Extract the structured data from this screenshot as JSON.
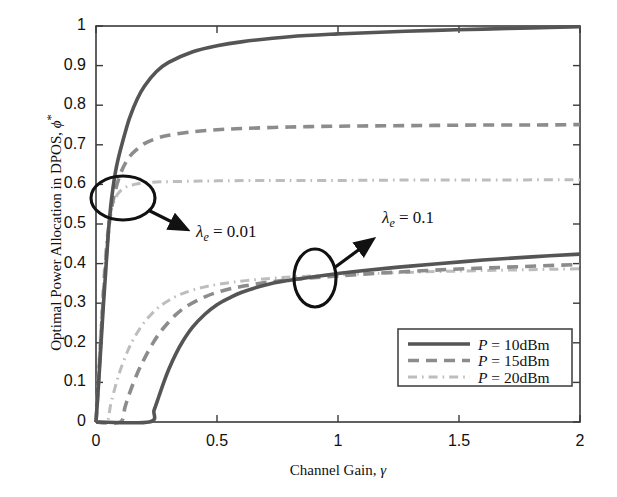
{
  "chart_data": {
    "type": "line",
    "title": "",
    "xlabel": "Channel Gain, γ",
    "ylabel": "Optimal Power Allocation in DPOS, ϕ*",
    "xlim": [
      0,
      2
    ],
    "ylim": [
      0,
      1
    ],
    "xticks": [
      "0",
      "0.5",
      "1",
      "1.5",
      "2"
    ],
    "xtick_values": [
      0,
      0.5,
      1,
      1.5,
      2
    ],
    "yticks": [
      "0",
      "0.1",
      "0.2",
      "0.3",
      "0.4",
      "0.5",
      "0.6",
      "0.7",
      "0.8",
      "0.9",
      "1"
    ],
    "ytick_values": [
      0,
      0.1,
      0.2,
      0.3,
      0.4,
      0.5,
      0.6,
      0.7,
      0.8,
      0.9,
      1
    ],
    "grid": false,
    "legend_position": "lower right",
    "legend": [
      {
        "label": "P = 10dBm",
        "style": "solid",
        "color": "#555555"
      },
      {
        "label": "P = 15dBm",
        "style": "dashed",
        "color": "#8c8c8c"
      },
      {
        "label": "P = 20dBm",
        "style": "dashdot",
        "color": "#bdbdbd"
      }
    ],
    "annotations": [
      {
        "text": "λ_e = 0.01",
        "display": "λ",
        "sub": "e",
        "rest": " = 0.01"
      },
      {
        "text": "λ_e = 0.1",
        "display": "λ",
        "sub": "e",
        "rest": " = 0.1"
      }
    ],
    "groups": [
      {
        "name": "λ_e = 0.01",
        "series": [
          {
            "name": "P = 10dBm",
            "style": "solid",
            "color": "#555555",
            "x": [
              0.0,
              0.01,
              0.02,
              0.03,
              0.04,
              0.05,
              0.06,
              0.07,
              0.08,
              0.09,
              0.1,
              0.12,
              0.14,
              0.17,
              0.2,
              0.25,
              0.3,
              0.4,
              0.5,
              0.6,
              0.8,
              1.0,
              1.2,
              1.4,
              1.6,
              1.8,
              2.0
            ],
            "y": [
              0.0,
              0.09,
              0.19,
              0.29,
              0.38,
              0.47,
              0.54,
              0.59,
              0.63,
              0.66,
              0.685,
              0.73,
              0.77,
              0.815,
              0.848,
              0.885,
              0.908,
              0.935,
              0.95,
              0.96,
              0.973,
              0.98,
              0.985,
              0.989,
              0.992,
              0.995,
              0.998
            ]
          },
          {
            "name": "P = 15dBm",
            "style": "dashed",
            "color": "#8c8c8c",
            "x": [
              0.0,
              0.01,
              0.02,
              0.03,
              0.04,
              0.05,
              0.06,
              0.08,
              0.1,
              0.12,
              0.15,
              0.2,
              0.25,
              0.3,
              0.4,
              0.5,
              0.6,
              0.8,
              1.0,
              1.2,
              1.4,
              1.6,
              1.8,
              2.0
            ],
            "y": [
              0.0,
              0.1,
              0.21,
              0.31,
              0.4,
              0.47,
              0.525,
              0.585,
              0.625,
              0.652,
              0.678,
              0.703,
              0.716,
              0.724,
              0.733,
              0.738,
              0.741,
              0.745,
              0.747,
              0.748,
              0.749,
              0.75,
              0.75,
              0.751
            ]
          },
          {
            "name": "P = 20dBm",
            "style": "dashdot",
            "color": "#bdbdbd",
            "x": [
              0.0,
              0.01,
              0.02,
              0.03,
              0.04,
              0.05,
              0.06,
              0.08,
              0.1,
              0.13,
              0.16,
              0.2,
              0.25,
              0.3,
              0.4,
              0.5,
              0.7,
              1.0,
              1.3,
              1.6,
              2.0
            ],
            "y": [
              0.0,
              0.12,
              0.24,
              0.345,
              0.43,
              0.49,
              0.528,
              0.565,
              0.583,
              0.595,
              0.6,
              0.604,
              0.606,
              0.607,
              0.608,
              0.609,
              0.61,
              0.61,
              0.611,
              0.611,
              0.612
            ]
          }
        ]
      },
      {
        "name": "λ_e = 0.1",
        "series": [
          {
            "name": "P = 10dBm",
            "style": "solid",
            "color": "#555555",
            "x": [
              0.0,
              0.22,
              0.24,
              0.26,
              0.28,
              0.3,
              0.33,
              0.36,
              0.4,
              0.45,
              0.5,
              0.55,
              0.6,
              0.7,
              0.8,
              0.9,
              1.0,
              1.1,
              1.25,
              1.4,
              1.6,
              1.8,
              2.0
            ],
            "y": [
              0.0,
              0.0,
              0.03,
              0.065,
              0.1,
              0.132,
              0.172,
              0.205,
              0.24,
              0.272,
              0.296,
              0.313,
              0.327,
              0.346,
              0.358,
              0.367,
              0.375,
              0.382,
              0.391,
              0.399,
              0.409,
              0.417,
              0.424
            ]
          },
          {
            "name": "P = 15dBm",
            "style": "dashed",
            "color": "#8c8c8c",
            "x": [
              0.0,
              0.1,
              0.12,
              0.14,
              0.17,
              0.2,
              0.24,
              0.28,
              0.33,
              0.38,
              0.45,
              0.52,
              0.6,
              0.7,
              0.85,
              1.0,
              1.2,
              1.45,
              1.7,
              2.0
            ],
            "y": [
              0.0,
              0.0,
              0.038,
              0.075,
              0.122,
              0.16,
              0.204,
              0.238,
              0.271,
              0.294,
              0.316,
              0.331,
              0.342,
              0.352,
              0.362,
              0.369,
              0.377,
              0.385,
              0.391,
              0.398
            ]
          },
          {
            "name": "P = 20dBm",
            "style": "dashdot",
            "color": "#bdbdbd",
            "x": [
              0.0,
              0.045,
              0.06,
              0.08,
              0.1,
              0.13,
              0.16,
              0.2,
              0.25,
              0.3,
              0.36,
              0.44,
              0.52,
              0.62,
              0.75,
              0.9,
              1.1,
              1.35,
              1.65,
              2.0
            ],
            "y": [
              0.0,
              0.0,
              0.042,
              0.09,
              0.13,
              0.178,
              0.215,
              0.252,
              0.285,
              0.307,
              0.325,
              0.34,
              0.349,
              0.357,
              0.364,
              0.369,
              0.374,
              0.379,
              0.383,
              0.387
            ]
          }
        ]
      }
    ]
  },
  "axes": {
    "frame_color": "#3a3a3a"
  }
}
